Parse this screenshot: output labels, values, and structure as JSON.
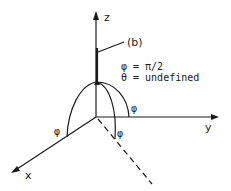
{
  "diagram": {
    "axes": {
      "x_label": "x",
      "y_label": "y",
      "z_label": "z"
    },
    "vector_label": "(b)",
    "equations": [
      "φ = π/2",
      "θ = undefined"
    ],
    "angle_labels": [
      "φ",
      "φ",
      "φ"
    ],
    "colors": {
      "ink": "#1a1a1a",
      "background": "#ffffff"
    }
  }
}
